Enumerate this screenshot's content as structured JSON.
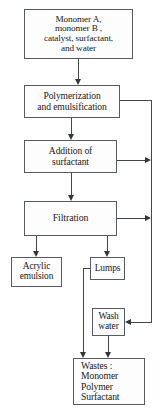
{
  "diagram": {
    "line_color": "#44484c",
    "box_border_color": "#555b60",
    "background": "#ffffff"
  },
  "nodes": {
    "feed": {
      "name": "raw-materials",
      "lines": [
        "Monomer A,",
        "monomer  B ,",
        "catalyst, surfactant,",
        "and water"
      ]
    },
    "polymerization": {
      "name": "polymerization-and-emulsification",
      "lines": [
        "Polymerization",
        "and emulsification"
      ]
    },
    "addition": {
      "name": "addition-of-surfactant",
      "lines": [
        "Addition of",
        "surfactant"
      ]
    },
    "filtration": {
      "name": "filtration",
      "lines": [
        "Filtration"
      ]
    },
    "acrylic": {
      "name": "acrylic-emulsion-product",
      "lines": [
        "Acrylic",
        "emulsion"
      ]
    },
    "lumps": {
      "name": "lumps",
      "lines": [
        "Lumps"
      ]
    },
    "wash": {
      "name": "wash-water",
      "lines": [
        "Wash",
        "water"
      ]
    },
    "wastes": {
      "name": "wastes",
      "lines": [
        "Wastes :",
        "  Monomer",
        "  Polymer",
        "  Surfactant"
      ]
    }
  },
  "edges": [
    {
      "id": "feed-to-polymerization",
      "from": "feed",
      "to": "polymerization",
      "arrow": "down"
    },
    {
      "id": "polymerization-to-addition",
      "from": "polymerization",
      "to": "addition",
      "arrow": "down"
    },
    {
      "id": "addition-to-filtration",
      "from": "addition",
      "to": "filtration",
      "arrow": "down"
    },
    {
      "id": "polymerization-to-riser",
      "from": "polymerization",
      "to": "right-riser",
      "arrow": "none"
    },
    {
      "id": "addition-to-riser",
      "from": "addition",
      "to": "right-riser",
      "arrow": "right"
    },
    {
      "id": "filtration-to-riser",
      "from": "filtration",
      "to": "right-riser",
      "arrow": "right"
    },
    {
      "id": "riser-to-wash",
      "from": "right-riser",
      "to": "wash",
      "arrow": "left"
    },
    {
      "id": "filtration-to-acrylic",
      "from": "filtration",
      "to": "acrylic",
      "arrow": "down"
    },
    {
      "id": "filtration-to-lumps",
      "from": "filtration",
      "to": "lumps",
      "arrow": "down"
    },
    {
      "id": "lumps-to-wastes",
      "from": "lumps",
      "to": "wastes",
      "arrow": "down"
    },
    {
      "id": "wash-to-wastes",
      "from": "wash",
      "to": "wastes",
      "arrow": "down"
    }
  ]
}
